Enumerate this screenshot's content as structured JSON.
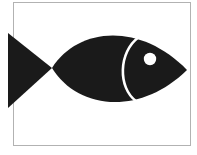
{
  "image": {
    "title": "Fish silhouette line art",
    "subject": "fish",
    "style": "high-contrast black silhouette on white",
    "width": 197,
    "height": 155,
    "background_color": "#ffffff",
    "ink_color": "#1a1a1a"
  },
  "frame": {
    "name": "page-border",
    "stroke_color": "#b2b2b2",
    "stroke_width": 1,
    "left": 13.5,
    "top": 2.5,
    "right": 190.5,
    "bottom": 145.5
  },
  "shapes": {
    "tail": {
      "name": "fish-tail",
      "color": "#1a1a1a",
      "description": "solid triangle, vertical edge clipped at left frame, apex meeting body",
      "points": "8,33 52,68 8,108"
    },
    "body": {
      "name": "fish-body",
      "color": "#1a1a1a",
      "description": "vesica / lens shaped body from tail joint to pointed snout",
      "path": "M52,68 C78,27 140,22 187,70 C140,116 78,110 52,68 Z"
    },
    "gill": {
      "name": "fish-gill-arc",
      "color": "#ffffff",
      "stroke_width": 2.6,
      "description": "white crescent arc separating head from body, bulging to the left",
      "path": "M139,37 C118,52 118,88 136,101"
    },
    "eye": {
      "name": "fish-eye",
      "color": "#ffffff",
      "cx": 150,
      "cy": 59,
      "r": 6.2
    }
  },
  "labels": {
    "alt_text": "Black silhouette of a fish facing right with a white circular eye and a white curved gill line, enclosed in a thin rectangular border."
  }
}
